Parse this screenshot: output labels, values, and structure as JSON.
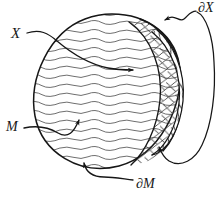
{
  "figure": {
    "kind": "hand-drawn-mathematical-diagram",
    "background_color": "#ffffff",
    "ink_color": "#161616",
    "hatch_color": "#3a3a3a",
    "labels": {
      "x": "X",
      "boundary_x": "∂X",
      "m": "M",
      "boundary_m": "∂M"
    },
    "regions": [
      {
        "name": "ball-M",
        "fill": "horizontal-hatching"
      },
      {
        "name": "crescent-band-X",
        "fill": "cross-hatching"
      },
      {
        "name": "lens-right",
        "fill": "dense-diagonal-hatching"
      }
    ],
    "pointers": [
      {
        "name": "pointer-X",
        "from": "X",
        "to": "crescent-band-X",
        "arrowhead": true
      },
      {
        "name": "pointer-boundary-X-top",
        "from": "∂X",
        "to": "upper-lens-edge",
        "arrowhead": true
      },
      {
        "name": "pointer-boundary-X-loop",
        "from": "∂X",
        "to": "lower-lens-edge",
        "arrowhead": true
      },
      {
        "name": "pointer-M",
        "from": "M",
        "to": "ball-interior",
        "arrowhead": true
      },
      {
        "name": "pointer-boundary-M",
        "from": "∂M",
        "to": "ball-outline-bottom",
        "arrowhead": true
      }
    ]
  }
}
